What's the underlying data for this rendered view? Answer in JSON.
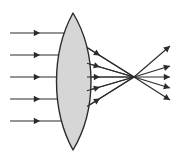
{
  "figure": {
    "title": "Converging (biconvex) lens focusing parallel light rays",
    "caption": "",
    "background_color": "#ffffff",
    "canvas": {
      "width": 180,
      "height": 153
    }
  },
  "lens": {
    "name": "biconvex-converging-lens",
    "label": "",
    "fill_color": "#d6d6d6",
    "stroke_color": "#2b2b2b",
    "top_vertex": {
      "x": 73,
      "y": 13
    },
    "bottom_vertex": {
      "x": 73,
      "y": 150
    },
    "left_edge_x": 57,
    "right_edge_x": 91,
    "center": {
      "x": 73,
      "y": 77
    }
  },
  "optical_axis": {
    "name": "optical-axis",
    "y": 77,
    "x_start": 2,
    "x_end": 178
  },
  "focal_point": {
    "name": "focal-point",
    "label": "",
    "x": 134,
    "y": 77
  },
  "colors": {
    "ray": "#2b2b2b",
    "lens_fill": "#d6d6d6",
    "lens_stroke": "#2b2b2b",
    "background": "#ffffff"
  },
  "rays": [
    {
      "id": "ray-1",
      "label": "",
      "incident": {
        "x1": 10,
        "y1": 33,
        "x2": 64,
        "y2": 33
      },
      "incident_arrow": {
        "x": 40,
        "y": 33
      },
      "refracted": {
        "x1": 64,
        "y1": 33,
        "x2": 134,
        "y2": 77
      },
      "refracted_arrow": {
        "x": 100,
        "y": 55.6
      },
      "diverged": {
        "x1": 134,
        "y1": 77,
        "x2": 170,
        "y2": 100
      },
      "diverged_arrow": {
        "x": 170,
        "y": 100
      }
    },
    {
      "id": "ray-2",
      "label": "",
      "incident": {
        "x1": 10,
        "y1": 55,
        "x2": 59,
        "y2": 55
      },
      "incident_arrow": {
        "x": 40,
        "y": 55
      },
      "refracted": {
        "x1": 59,
        "y1": 55,
        "x2": 134,
        "y2": 77
      },
      "refracted_arrow": {
        "x": 100,
        "y": 67
      },
      "diverged": {
        "x1": 134,
        "y1": 77,
        "x2": 170,
        "y2": 88
      },
      "diverged_arrow": {
        "x": 170,
        "y": 88
      }
    },
    {
      "id": "ray-3",
      "label": "",
      "incident": {
        "x1": 10,
        "y1": 77,
        "x2": 57,
        "y2": 77
      },
      "incident_arrow": {
        "x": 40,
        "y": 77
      },
      "refracted": {
        "x1": 57,
        "y1": 77,
        "x2": 134,
        "y2": 77
      },
      "refracted_arrow": {
        "x": 100,
        "y": 77
      },
      "diverged": {
        "x1": 134,
        "y1": 77,
        "x2": 170,
        "y2": 77
      },
      "diverged_arrow": {
        "x": 170,
        "y": 77
      }
    },
    {
      "id": "ray-4",
      "label": "",
      "incident": {
        "x1": 10,
        "y1": 99,
        "x2": 59,
        "y2": 99
      },
      "incident_arrow": {
        "x": 40,
        "y": 99
      },
      "refracted": {
        "x1": 59,
        "y1": 99,
        "x2": 134,
        "y2": 77
      },
      "refracted_arrow": {
        "x": 100,
        "y": 87
      },
      "diverged": {
        "x1": 134,
        "y1": 77,
        "x2": 170,
        "y2": 66
      },
      "diverged_arrow": {
        "x": 170,
        "y": 66
      }
    },
    {
      "id": "ray-5",
      "label": "",
      "incident": {
        "x1": 10,
        "y1": 121,
        "x2": 64,
        "y2": 121
      },
      "incident_arrow": {
        "x": 40,
        "y": 121
      },
      "refracted": {
        "x1": 64,
        "y1": 121,
        "x2": 134,
        "y2": 77
      },
      "refracted_arrow": {
        "x": 100,
        "y": 98.4
      },
      "diverged": {
        "x1": 134,
        "y1": 77,
        "x2": 170,
        "y2": 46
      },
      "diverged_arrow": {
        "x": 170,
        "y": 46
      }
    }
  ],
  "chart_data": {
    "type": "diagram",
    "ray_count": 5,
    "incident_ray_y_positions": [
      33,
      55,
      77,
      99,
      121
    ],
    "focal_point_x": 134,
    "focal_point_y": 77,
    "lens_type": "biconvex converging",
    "legend": [],
    "annotations": []
  }
}
